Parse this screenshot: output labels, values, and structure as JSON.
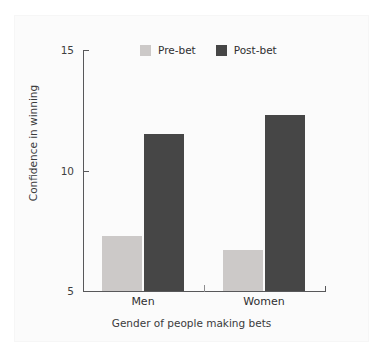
{
  "chart_data": {
    "type": "bar",
    "title": "",
    "subtitle": "",
    "xlabel": "Gender of people making bets",
    "ylabel": "Confidence in winning",
    "categories": [
      "Men",
      "Women"
    ],
    "series": [
      {
        "name": "Pre-bet",
        "color": "#ccc9c8",
        "values": [
          7.3,
          6.7
        ]
      },
      {
        "name": "Post-bet",
        "color": "#464646",
        "values": [
          11.5,
          12.3
        ]
      }
    ],
    "ylim": [
      5,
      15
    ],
    "yticks": [
      5,
      10,
      15
    ],
    "ytick_labels": [
      "5",
      "10",
      "15"
    ],
    "grid": false,
    "legend_position": "top-center",
    "annotations": []
  },
  "axes": {
    "y_tick_top": "15",
    "y_tick_mid": "10",
    "y_tick_bottom": "5",
    "y_axis_title": "Confidence in winning",
    "x_axis_title": "Gender of people making bets",
    "x_cat_1": "Men",
    "x_cat_2": "Women"
  },
  "legend": {
    "items": [
      {
        "label": "Pre-bet",
        "color": "#ccc9c8"
      },
      {
        "label": "Post-bet",
        "color": "#464646"
      }
    ]
  },
  "colors": {
    "pre_bet": "#ccc9c8",
    "post_bet": "#464646",
    "axis": "#58585a",
    "text": "#2f2f31",
    "background": "#ffffff",
    "panel": "#fbfbfb"
  }
}
